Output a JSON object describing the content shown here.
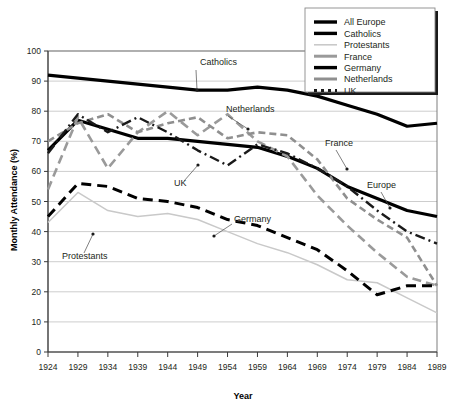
{
  "chart_data": {
    "type": "line",
    "title": "",
    "xlabel": "Year",
    "ylabel": "Monthly Attendance (%)",
    "xlim": [
      1924,
      1989
    ],
    "ylim": [
      0,
      100
    ],
    "grid": true,
    "legend_position": "top-right",
    "x": [
      1924,
      1929,
      1934,
      1939,
      1944,
      1949,
      1954,
      1959,
      1964,
      1969,
      1974,
      1979,
      1984,
      1989
    ],
    "xticklabels": [
      "1924",
      "1929",
      "1934",
      "1939",
      "1944",
      "1949",
      "1954",
      "1959",
      "1964",
      "1969",
      "1974",
      "1979",
      "1984",
      "1989"
    ],
    "yticklabels": [
      "0",
      "10",
      "20",
      "30",
      "40",
      "50",
      "60",
      "70",
      "80",
      "90",
      "100"
    ],
    "yticks": [
      0,
      10,
      20,
      30,
      40,
      50,
      60,
      70,
      80,
      90,
      100
    ],
    "series": [
      {
        "name": "All Europe",
        "style": "solid-thick-black",
        "color": "#000000",
        "width": 3.2,
        "dash": "none",
        "values": [
          67,
          77,
          74,
          71,
          71,
          70,
          69,
          68,
          65,
          61,
          55,
          51,
          47,
          45
        ]
      },
      {
        "name": "Catholics",
        "style": "solid-thick-black",
        "color": "#000000",
        "width": 3.2,
        "dash": "none",
        "values": [
          92,
          91,
          90,
          89,
          88,
          87,
          87,
          88,
          87,
          85,
          82,
          79,
          75,
          76
        ]
      },
      {
        "name": "Protestants",
        "style": "solid-thin-lightgray",
        "color": "#c9c9c9",
        "width": 1.5,
        "dash": "none",
        "values": [
          43,
          53,
          47,
          45,
          46,
          44,
          40,
          36,
          33,
          29,
          24,
          23,
          18,
          13
        ]
      },
      {
        "name": "France",
        "style": "dashed-gray",
        "color": "#9a9a9a",
        "width": 2.6,
        "dash": "9,5",
        "values": [
          54,
          78,
          61,
          73,
          80,
          72,
          79,
          70,
          65,
          52,
          42,
          33,
          25,
          22
        ]
      },
      {
        "name": "Germany",
        "style": "dashed-black",
        "color": "#000000",
        "width": 3.0,
        "dash": "10,6",
        "values": [
          45,
          56,
          55,
          51,
          50,
          48,
          44,
          42,
          38,
          34,
          27,
          19,
          22,
          22
        ]
      },
      {
        "name": "Netherlands",
        "style": "dashed-gray-short",
        "color": "#8f8f8f",
        "width": 2.6,
        "dash": "7,4",
        "values": [
          70,
          76,
          79,
          73,
          76,
          78,
          71,
          73,
          72,
          64,
          51,
          44,
          38,
          22
        ]
      },
      {
        "name": "UK",
        "style": "dash-dot-black",
        "color": "#1a1a1a",
        "width": 2.4,
        "dash": "10,4,2,4",
        "values": [
          66,
          79,
          73,
          78,
          73,
          67,
          62,
          69,
          66,
          61,
          55,
          47,
          40,
          36
        ]
      }
    ],
    "annotations": [
      {
        "label": "Catholics",
        "x": 200,
        "y": 65,
        "lx1": 196,
        "ly1": 70,
        "lx2": 197,
        "ly2": 90
      },
      {
        "label": "Netherlands",
        "x": 226,
        "y": 112,
        "lx1": 228,
        "ly1": 116,
        "lx2": 248,
        "ly2": 129
      },
      {
        "label": "France",
        "x": 325,
        "y": 146,
        "lx1": 336,
        "ly1": 150,
        "lx2": 347,
        "ly2": 169
      },
      {
        "label": "UK",
        "x": 174,
        "y": 186,
        "lx1": 184,
        "ly1": 181,
        "lx2": 198,
        "ly2": 165
      },
      {
        "label": "Germany",
        "x": 234,
        "y": 222,
        "lx1": 232,
        "ly1": 224,
        "lx2": 214,
        "ly2": 236
      },
      {
        "label": "Europe",
        "x": 367,
        "y": 188,
        "lx1": 381,
        "ly1": 192,
        "lx2": 390,
        "ly2": 208
      },
      {
        "label": "Protestants",
        "x": 62,
        "y": 259,
        "lx1": 84,
        "ly1": 253,
        "lx2": 93,
        "ly2": 234
      }
    ],
    "legend_entries": [
      {
        "label": "All Europe",
        "color": "#000000",
        "width": 3.4,
        "dash": "none"
      },
      {
        "label": "Catholics",
        "color": "#000000",
        "width": 3.4,
        "dash": "none"
      },
      {
        "label": "Protestants",
        "color": "#c9c9c9",
        "width": 1.6,
        "dash": "none"
      },
      {
        "label": "France",
        "color": "#9a9a9a",
        "width": 3.0,
        "dash": "none"
      },
      {
        "label": "Germany",
        "color": "#000000",
        "width": 3.4,
        "dash": "none"
      },
      {
        "label": "Netherlands",
        "color": "#8f8f8f",
        "width": 3.0,
        "dash": "none"
      },
      {
        "label": "UK",
        "color": "#1a1a1a",
        "width": 3.0,
        "dash": "3,4"
      }
    ]
  }
}
